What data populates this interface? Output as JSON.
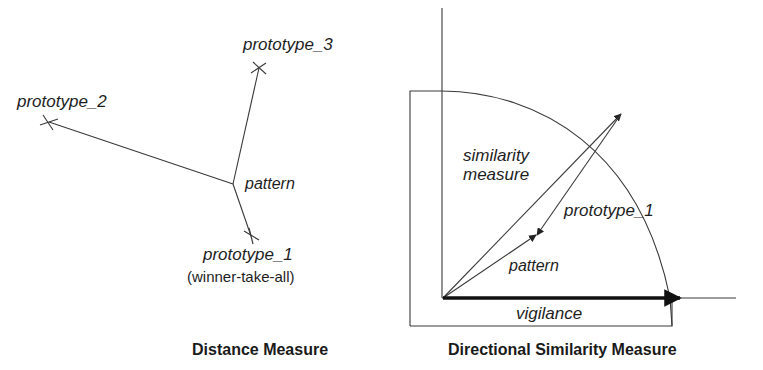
{
  "left_diagram": {
    "labels": {
      "prototype_3": "prototype_3",
      "prototype_2": "prototype_2",
      "pattern": "pattern",
      "prototype_1": "prototype_1",
      "winner_note": "(winner-take-all)"
    },
    "caption": "Distance Measure"
  },
  "right_diagram": {
    "labels": {
      "similarity_line1": "similarity",
      "similarity_line2": "measure",
      "prototype_1": "prototype_1",
      "pattern": "pattern",
      "vigilance": "vigilance"
    },
    "caption": "Directional Similarity Measure"
  },
  "colors": {
    "line": "#3a3a3a",
    "text": "#1e1e1e",
    "background": "#ffffff"
  }
}
